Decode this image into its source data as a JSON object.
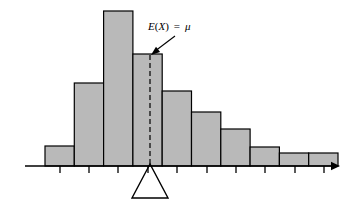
{
  "figure": {
    "name": "expected-value-balance-point-histogram",
    "background_color": "#ffffff",
    "width": 340,
    "height": 206
  },
  "annotation": {
    "label_e": "E",
    "label_open_paren": "(",
    "label_x": "X",
    "label_close_paren": ")",
    "label_equals": "=",
    "label_mu": "μ",
    "label_full": "E(X) = μ",
    "label_x_px": 148,
    "label_y_px": 30,
    "pointer_from_x": 175,
    "pointer_from_y": 36,
    "pointer_to_x": 151,
    "pointer_to_y": 55
  },
  "axis": {
    "name": "horizontal-axis",
    "y_px": 166,
    "x_start_px": 25,
    "x_end_px": 331,
    "color": "#000000",
    "tick_length_px": 7,
    "tick_positions_px": [
      60,
      89,
      118,
      148,
      177,
      207,
      236,
      265,
      295,
      324
    ],
    "arrow_head": "right"
  },
  "fulcrum": {
    "name": "balance-point-triangle",
    "apex_x_px": 150,
    "apex_y_px": 164,
    "base_left_x_px": 132,
    "base_right_x_px": 168,
    "base_y_px": 198,
    "stroke_color": "#000000",
    "fill": "none"
  },
  "mean_line": {
    "name": "mean-dashed-line",
    "x_px": 150,
    "y_top_px": 55,
    "y_bottom_px": 166,
    "dash_pattern": "5 3",
    "color": "#1a1a1a"
  },
  "style": {
    "bar_fill": "#b9b9b9",
    "bar_stroke": "#000000",
    "axis_color": "#000000",
    "text_color": "#000000"
  },
  "chart_data": {
    "type": "bar",
    "title": "",
    "subtitle": "",
    "xlabel": "",
    "ylabel": "",
    "grid": false,
    "legend": "none",
    "note": "Histogram of a right-skewed distribution balanced on a fulcrum at the mean E(X) = μ",
    "baseline_y_px": 166,
    "bar_width_px": 29.3,
    "first_bar_left_px": 45,
    "categories": [
      "1",
      "2",
      "3",
      "4",
      "5",
      "6",
      "7",
      "8",
      "9",
      "10"
    ],
    "values": [
      20,
      83,
      155,
      112,
      75,
      54,
      37,
      19,
      13,
      13
    ],
    "bar_top_px": [
      146,
      83,
      11,
      54,
      91,
      112,
      129,
      147,
      153,
      153
    ],
    "ylim": [
      0,
      155
    ],
    "annotations": [
      {
        "text": "E(X) = μ",
        "points_to_bar_index": 3,
        "kind": "mean-marker"
      }
    ]
  }
}
